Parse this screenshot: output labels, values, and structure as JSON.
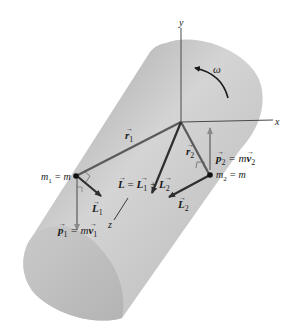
{
  "figure": {
    "colors": {
      "background": "#ffffff",
      "cylinder_light": "#d6d6d6",
      "cylinder_dark": "#a8a8a8",
      "vector_dark": "#3a3a3a",
      "vector_light": "#8e8e8e",
      "axis": "#4a4a4a"
    }
  },
  "axes": {
    "x_label": "x",
    "y_label": "y",
    "z_label": "z"
  },
  "rotation": {
    "label": "ω"
  },
  "vectors": {
    "r1": {
      "symbol": "r",
      "sub": "1"
    },
    "r2": {
      "symbol": "r",
      "sub": "2"
    },
    "L_total": {
      "lhs": "L",
      "eq": " = ",
      "a": "L",
      "a_sub": "1",
      "plus": " + ",
      "b": "L",
      "b_sub": "2"
    },
    "L1": {
      "symbol": "L",
      "sub": "1"
    },
    "L2": {
      "symbol": "L",
      "sub": "2"
    },
    "p1": {
      "symbol": "p",
      "sub": "1",
      "eq": " = m",
      "v": "v",
      "v_sub": "1"
    },
    "p2": {
      "symbol": "p",
      "sub": "2",
      "eq": " = m",
      "v": "v",
      "v_sub": "2"
    }
  },
  "masses": {
    "m1": {
      "name": "m",
      "sub": "1",
      "eq": " = m"
    },
    "m2": {
      "name": "m",
      "sub": "2",
      "eq": " = m"
    }
  }
}
